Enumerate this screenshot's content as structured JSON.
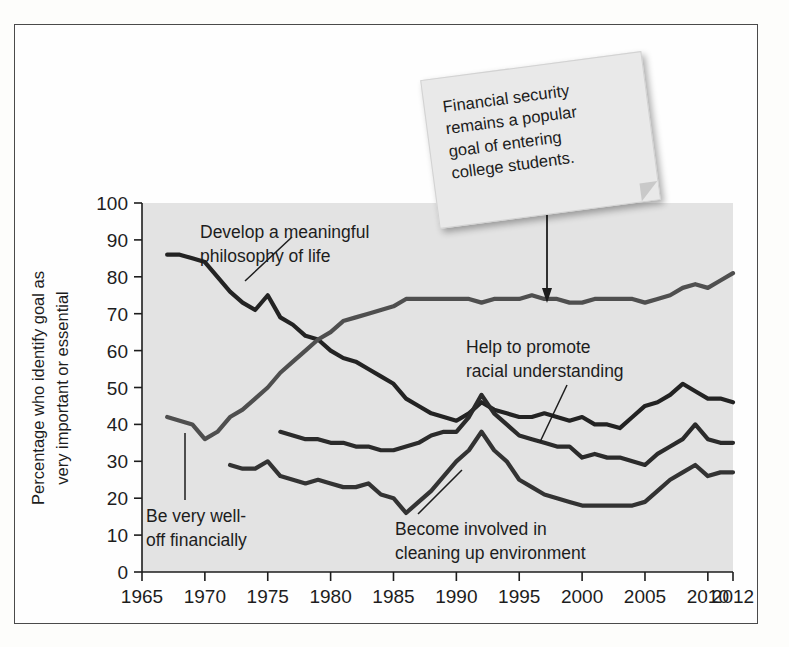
{
  "figure": {
    "background_color": "#fefefe",
    "plot_background_color": "#e3e3e3",
    "border_color": "#4a4a4a"
  },
  "sticky_note": {
    "name": "callout-note",
    "color": "#e9e9e9",
    "lines": [
      "Financial security",
      "remains a popular",
      "goal of entering",
      "college students."
    ]
  },
  "chart_data": {
    "type": "line",
    "title": "",
    "xlabel": "",
    "ylabel": "Percentage who identify goal as\nvery important or essential",
    "ylabel_line1": "Percentage who identify goal as",
    "ylabel_line2": "very important or essential",
    "xlim": [
      1965,
      2012
    ],
    "ylim": [
      0,
      100
    ],
    "grid": false,
    "legend": "inline-annotations",
    "xticks": [
      1965,
      1970,
      1975,
      1980,
      1985,
      1990,
      1995,
      2000,
      2005,
      2010,
      2012
    ],
    "xtick_labels": [
      "1965",
      "1970",
      "1975",
      "1980",
      "1985",
      "1990",
      "1995",
      "2000",
      "2005",
      "2010",
      "2012"
    ],
    "yticks": [
      0,
      10,
      20,
      30,
      40,
      50,
      60,
      70,
      80,
      90,
      100
    ],
    "ytick_labels": [
      "0",
      "10",
      "20",
      "30",
      "40",
      "50",
      "60",
      "70",
      "80",
      "90",
      "100"
    ],
    "series": [
      {
        "name": "Develop a meaningful philosophy of life",
        "color": "#232323",
        "label": "Develop a meaningful\nphilosophy of life",
        "label_line1": "Develop a meaningful",
        "label_line2": "philosophy of life",
        "x": [
          1967,
          1968,
          1969,
          1970,
          1971,
          1972,
          1973,
          1974,
          1975,
          1976,
          1977,
          1978,
          1979,
          1980,
          1981,
          1982,
          1983,
          1984,
          1985,
          1986,
          1987,
          1988,
          1989,
          1990,
          1991,
          1992,
          1993,
          1994,
          1995,
          1996,
          1997,
          1998,
          1999,
          2000,
          2001,
          2002,
          2003,
          2004,
          2005,
          2006,
          2007,
          2008,
          2009,
          2010,
          2011,
          2012
        ],
        "y": [
          86,
          86,
          85,
          84,
          80,
          76,
          73,
          71,
          75,
          69,
          67,
          64,
          63,
          60,
          58,
          57,
          55,
          53,
          51,
          47,
          45,
          43,
          42,
          41,
          43,
          46,
          44,
          43,
          42,
          42,
          43,
          42,
          41,
          42,
          40,
          40,
          39,
          42,
          45,
          46,
          48,
          51,
          49,
          47,
          47,
          46
        ]
      },
      {
        "name": "Be very well-off financially",
        "color": "#4f4f4f",
        "label": "Be very well-\noff financially",
        "label_line1": "Be very well-",
        "label_line2": "off financially",
        "x": [
          1967,
          1968,
          1969,
          1970,
          1971,
          1972,
          1973,
          1974,
          1975,
          1976,
          1977,
          1978,
          1979,
          1980,
          1981,
          1982,
          1983,
          1984,
          1985,
          1986,
          1987,
          1988,
          1989,
          1990,
          1991,
          1992,
          1993,
          1994,
          1995,
          1996,
          1997,
          1998,
          1999,
          2000,
          2001,
          2002,
          2003,
          2004,
          2005,
          2006,
          2007,
          2008,
          2009,
          2010,
          2011,
          2012
        ],
        "y": [
          42,
          41,
          40,
          36,
          38,
          42,
          44,
          47,
          50,
          54,
          57,
          60,
          63,
          65,
          68,
          69,
          70,
          71,
          72,
          74,
          74,
          74,
          74,
          74,
          74,
          73,
          74,
          74,
          74,
          75,
          74,
          74,
          73,
          73,
          74,
          74,
          74,
          74,
          73,
          74,
          75,
          77,
          78,
          77,
          79,
          81
        ]
      },
      {
        "name": "Help to promote racial understanding",
        "color": "#2b2b2b",
        "label": "Help to promote\nracial understanding",
        "label_line1": "Help to promote",
        "label_line2": "racial understanding",
        "x": [
          1976,
          1977,
          1978,
          1979,
          1980,
          1981,
          1982,
          1983,
          1984,
          1985,
          1986,
          1987,
          1988,
          1989,
          1990,
          1991,
          1992,
          1993,
          1994,
          1995,
          1996,
          1997,
          1998,
          1999,
          2000,
          2001,
          2002,
          2003,
          2004,
          2005,
          2006,
          2007,
          2008,
          2009,
          2010,
          2011,
          2012
        ],
        "y": [
          38,
          37,
          36,
          36,
          35,
          35,
          34,
          34,
          33,
          33,
          34,
          35,
          37,
          38,
          38,
          42,
          48,
          43,
          40,
          37,
          36,
          35,
          34,
          34,
          31,
          32,
          31,
          31,
          30,
          29,
          32,
          34,
          36,
          40,
          36,
          35,
          35
        ]
      },
      {
        "name": "Become involved in cleaning up environment",
        "color": "#333333",
        "label": "Become involved in\ncleaning up environment",
        "label_line1": "Become involved in",
        "label_line2": "cleaning up environment",
        "x": [
          1972,
          1973,
          1974,
          1975,
          1976,
          1977,
          1978,
          1979,
          1980,
          1981,
          1982,
          1983,
          1984,
          1985,
          1986,
          1987,
          1988,
          1989,
          1990,
          1991,
          1992,
          1993,
          1994,
          1995,
          1996,
          1997,
          1998,
          1999,
          2000,
          2001,
          2002,
          2003,
          2004,
          2005,
          2006,
          2007,
          2008,
          2009,
          2010,
          2011,
          2012
        ],
        "y": [
          29,
          28,
          28,
          30,
          26,
          25,
          24,
          25,
          24,
          23,
          23,
          24,
          21,
          20,
          16,
          19,
          22,
          26,
          30,
          33,
          38,
          33,
          30,
          25,
          23,
          21,
          20,
          19,
          18,
          18,
          18,
          18,
          18,
          19,
          22,
          25,
          27,
          29,
          26,
          27,
          27
        ]
      }
    ],
    "annotations": [
      {
        "text": "Financial security remains a popular goal of entering college students.",
        "points_to": "Be very well-off financially"
      }
    ]
  }
}
